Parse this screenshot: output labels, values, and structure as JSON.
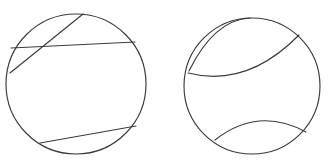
{
  "figure": {
    "background_color": "#ffffff",
    "stroke_color": "#3a3a3a",
    "stroke_width": 1.15,
    "width": 330,
    "height": 166,
    "shape_count": 2
  },
  "chart_data": {
    "type": "diagram",
    "xlabel": "",
    "ylabel": "",
    "xlim": [
      0,
      330
    ],
    "ylim": [
      0,
      166
    ],
    "grid": false,
    "legend": "none",
    "background_color": "#ffffff",
    "stroke_color": "#3a3a3a",
    "shapes": [
      {
        "name": "left-circle",
        "kind": "circle",
        "cx": 76,
        "cy": 84,
        "r": 70,
        "cut_type": "straight-chords",
        "cut_count": 3,
        "region_count": 7
      },
      {
        "name": "right-circle",
        "kind": "circle",
        "cx": 252,
        "cy": 86,
        "r": 68,
        "cut_type": "curved-arcs",
        "cut_count": 3,
        "region_count": 6
      }
    ],
    "left_circle_chords": [
      {
        "name": "chord-upper-long",
        "x1": 11,
        "y1": 48,
        "x2": 135,
        "y2": 42
      },
      {
        "name": "chord-upper-steep",
        "x1": 10,
        "y1": 73,
        "x2": 83,
        "y2": 14
      },
      {
        "name": "chord-lower",
        "x1": 40,
        "y1": 143,
        "x2": 136,
        "y2": 126
      }
    ],
    "right_circle_arcs": [
      {
        "name": "arc-from-top",
        "x1": 250,
        "y1": 18,
        "x2": 189,
        "y2": 71,
        "cx": 214,
        "cy": 20,
        "bulge": "concave-right"
      },
      {
        "name": "arc-from-upper-right",
        "x1": 299,
        "y1": 35,
        "x2": 188,
        "y2": 73,
        "cx": 247,
        "cy": 88,
        "bulge": "concave-up"
      },
      {
        "name": "arc-bottom",
        "x1": 215,
        "y1": 140,
        "x2": 306,
        "y2": 132,
        "cx": 258,
        "cy": 106,
        "bulge": "concave-down"
      }
    ]
  }
}
